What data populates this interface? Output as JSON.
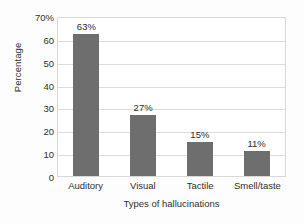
{
  "chart_data": {
    "type": "bar",
    "title": "",
    "categories": [
      "Auditory",
      "Visual",
      "Tactile",
      "Smell/taste"
    ],
    "values": [
      63,
      27,
      15,
      11
    ],
    "value_labels": [
      "63%",
      "27%",
      "15%",
      "11%"
    ],
    "xlabel": "Types of hallucinations",
    "ylabel": "Percentage",
    "ylim": [
      0,
      70
    ],
    "ytick_values": [
      0,
      10,
      20,
      30,
      40,
      50,
      60,
      70
    ],
    "ytick_labels": [
      "0",
      "10",
      "20",
      "30",
      "40",
      "50",
      "60",
      "70%"
    ],
    "grid": true,
    "legend": null,
    "bar_color": "#6e6e6e",
    "gridline_color": "#dddddd",
    "axis_border_color": "#d8d8d8",
    "background_color": "#fdfdfd",
    "text_color": "#2f2f2f"
  }
}
